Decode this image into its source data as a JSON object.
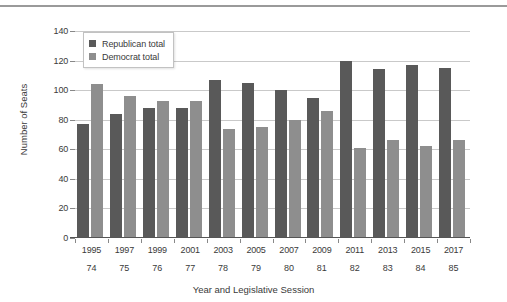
{
  "figure": {
    "has_top_rule": true,
    "background": "#ffffff"
  },
  "chart_data": {
    "type": "bar",
    "title": "",
    "subtitle": "",
    "xlabel": "Year and Legislative Session",
    "ylabel": "Number of Seats",
    "categories": [
      "1995",
      "1997",
      "1999",
      "2001",
      "2003",
      "2005",
      "2007",
      "2009",
      "2011",
      "2013",
      "2015",
      "2017"
    ],
    "category_sublabels": [
      "74",
      "75",
      "76",
      "77",
      "78",
      "79",
      "80",
      "81",
      "82",
      "83",
      "84",
      "85"
    ],
    "series": [
      {
        "name": "Republican total",
        "color": "#595959",
        "values": [
          77,
          84,
          88,
          88,
          107,
          105,
          100,
          95,
          120,
          114,
          117,
          115
        ]
      },
      {
        "name": "Democrat total",
        "color": "#8e8e8e",
        "values": [
          104,
          96,
          93,
          93,
          74,
          75,
          80,
          86,
          61,
          66,
          62,
          66
        ]
      }
    ],
    "ylim": [
      0,
      140
    ],
    "yticks": [
      0,
      20,
      40,
      60,
      80,
      100,
      120,
      140
    ],
    "ytick_labels": [
      "0",
      "20",
      "40",
      "60",
      "80",
      "100",
      "120",
      "140"
    ],
    "grid": "horizontal",
    "legend_position": "top-left-inside",
    "bar_group_count": 12
  }
}
